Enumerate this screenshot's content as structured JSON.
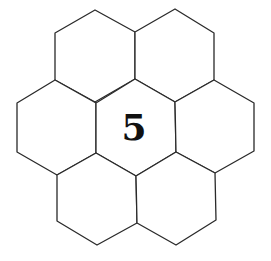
{
  "diagram": {
    "type": "hexagonal-grid",
    "cell_count": 7,
    "line_color": "#2a2a2a",
    "cells": [
      {
        "id": "top-left",
        "label": "",
        "points": "95,10 135,32 135,79 95,102 55,80 55,33"
      },
      {
        "id": "top-right",
        "label": "",
        "points": "175,9 214,33 214,80 175,102 135,79 135,32"
      },
      {
        "id": "middle-left",
        "label": "",
        "points": "55,80 96,103 96,153 57,175 17,152 17,103"
      },
      {
        "id": "center",
        "label": "5",
        "points": "135,79 175,102 176,152 136,176 96,153 96,103"
      },
      {
        "id": "middle-right",
        "label": "",
        "points": "214,80 254,103 254,151 215,173 176,152 175,102"
      },
      {
        "id": "bottom-left",
        "label": "",
        "points": "96,153 136,176 137,223 97,245 57,221 57,175"
      },
      {
        "id": "bottom-right",
        "label": "",
        "points": "176,152 215,173 216,220 176,245 137,223 136,176"
      }
    ],
    "center_label": "5"
  }
}
